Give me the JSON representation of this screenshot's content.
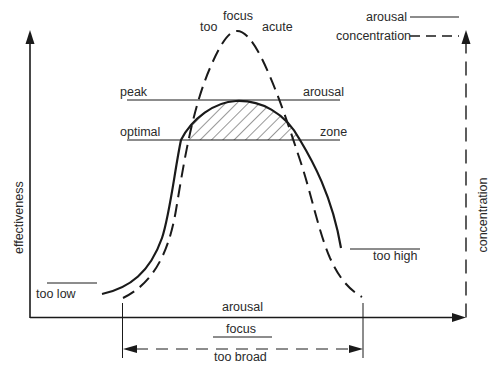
{
  "diagram": {
    "colors": {
      "ink": "#1a1a1a",
      "background": "#ffffff"
    },
    "legend": {
      "items": [
        {
          "label": "arousal",
          "style": "solid"
        },
        {
          "label": "concentration",
          "style": "dashed"
        }
      ]
    },
    "axes": {
      "y_left": "effectiveness",
      "y_right": "concentration",
      "x": "arousal"
    },
    "curve_labels": {
      "top_left": "too",
      "top_center": "focus",
      "top_right": "acute"
    },
    "reference_lines": {
      "peak_left": "peak",
      "peak_right": "arousal",
      "optimal_left": "optimal",
      "optimal_right": "zone"
    },
    "level_labels": {
      "too_low": "too low",
      "too_high": "too high"
    },
    "bracket": {
      "top": "focus",
      "bottom": "too broad"
    },
    "nodes": [
      {
        "id": "arousal-curve",
        "type": "solid-curve",
        "meaning": "arousal"
      },
      {
        "id": "concentration-curve",
        "type": "dashed-curve",
        "meaning": "concentration"
      },
      {
        "id": "optimal-zone",
        "type": "hatched-region",
        "between": [
          "peak arousal",
          "optimal zone"
        ]
      }
    ]
  }
}
